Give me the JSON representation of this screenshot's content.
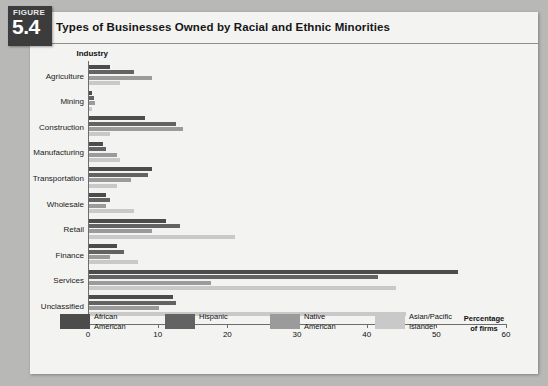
{
  "figure": {
    "word": "FIGURE",
    "number": "5.4"
  },
  "chart_data": {
    "type": "bar",
    "orientation": "horizontal",
    "title": "Types of Businesses Owned by Racial and Ethnic Minorities",
    "xlabel": "Percentage of firms",
    "ylabel": "Industry",
    "xlim": [
      0,
      60
    ],
    "xticks": [
      0,
      10,
      20,
      30,
      40,
      50,
      60
    ],
    "xtick_labels": [
      "0",
      "10",
      "20",
      "30",
      "40",
      "50",
      "60"
    ],
    "grid": false,
    "legend_position": "bottom",
    "categories": [
      "Agriculture",
      "Mining",
      "Construction",
      "Manufacturing",
      "Transportation",
      "Wholesale",
      "Retail",
      "Finance",
      "Services",
      "Unclassified"
    ],
    "series": [
      {
        "name": "African American",
        "color": "#4c4c4c",
        "values": [
          3.0,
          0.5,
          8.0,
          2.0,
          9.0,
          2.5,
          11.0,
          4.0,
          53.0,
          12.0
        ]
      },
      {
        "name": "Hispanic",
        "color": "#636363",
        "values": [
          6.5,
          0.7,
          12.5,
          2.5,
          8.5,
          3.0,
          13.0,
          5.0,
          41.5,
          12.5
        ]
      },
      {
        "name": "Native American",
        "color": "#9b9b9b",
        "values": [
          9.0,
          0.9,
          13.5,
          4.0,
          6.0,
          2.5,
          9.0,
          3.0,
          17.5,
          10.0
        ]
      },
      {
        "name": "Asian/Pacific Islander",
        "color": "#c9c9c9",
        "values": [
          4.5,
          0.4,
          3.0,
          4.5,
          4.0,
          6.5,
          21.0,
          7.0,
          44.0,
          45.5
        ]
      }
    ]
  }
}
